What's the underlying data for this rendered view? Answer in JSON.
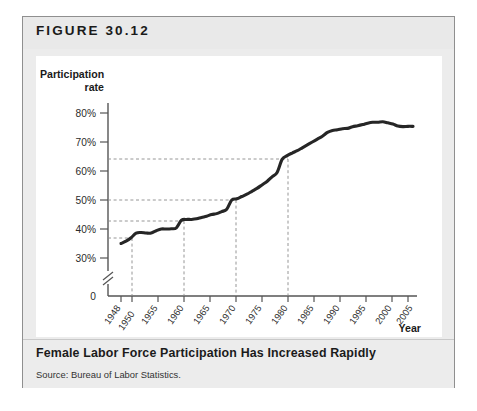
{
  "figure": {
    "label": "FIGURE 30.12",
    "caption_title": "Female Labor Force Participation Has Increased Rapidly",
    "source": "Source: Bureau of Labor Statistics."
  },
  "chart_data": {
    "type": "line",
    "title": "Female Labor Force Participation Has Increased Rapidly",
    "xlabel": "Year",
    "ylabel": "Participation rate",
    "ylabel_line1": "Participation",
    "ylabel_line2": "rate",
    "grid": false,
    "legend": "none",
    "axis_break": true,
    "axis_break_note": "y-axis broken between 0 and 30%",
    "xlim": [
      1948,
      2007
    ],
    "ylim": [
      28,
      82
    ],
    "ytick_labels": [
      "30%",
      "40%",
      "50%",
      "60%",
      "70%",
      "80%"
    ],
    "ytick_values": [
      30,
      40,
      50,
      60,
      70,
      80
    ],
    "zero_label": "0",
    "xtick_labels": [
      "1948",
      "1950",
      "1955",
      "1960",
      "1965",
      "1970",
      "1975",
      "1980",
      "1985",
      "1990",
      "1995",
      "2000",
      "2005"
    ],
    "xtick_values": [
      1948,
      1950,
      1955,
      1960,
      1965,
      1970,
      1975,
      1980,
      1985,
      1990,
      1995,
      2000,
      2005
    ],
    "guides": [
      {
        "year": 1950,
        "value": 37
      },
      {
        "year": 1960,
        "value": 43
      },
      {
        "year": 1970,
        "value": 50
      },
      {
        "year": 1980,
        "value": 64
      }
    ],
    "series": [
      {
        "name": "Female labor force participation rate",
        "x": [
          1948,
          1949,
          1950,
          1951,
          1952,
          1953,
          1954,
          1955,
          1956,
          1957,
          1958,
          1959,
          1960,
          1961,
          1962,
          1963,
          1964,
          1965,
          1966,
          1967,
          1968,
          1969,
          1970,
          1971,
          1972,
          1973,
          1974,
          1975,
          1976,
          1977,
          1978,
          1979,
          1980,
          1981,
          1982,
          1983,
          1984,
          1985,
          1986,
          1987,
          1988,
          1989,
          1990,
          1991,
          1992,
          1993,
          1994,
          1995,
          1996,
          1997,
          1998,
          1999,
          2000,
          2001,
          2002,
          2003,
          2004,
          2005,
          2006
        ],
        "values": [
          35.0,
          35.8,
          37.0,
          38.6,
          38.8,
          38.6,
          38.6,
          39.4,
          40.0,
          40.0,
          40.1,
          40.4,
          43.0,
          43.3,
          43.3,
          43.5,
          44.0,
          44.4,
          45.0,
          45.3,
          46.0,
          46.8,
          50.0,
          50.4,
          51.2,
          52.0,
          53.0,
          54.0,
          55.2,
          56.4,
          58.0,
          59.5,
          64.0,
          65.3,
          66.2,
          67.0,
          68.0,
          69.0,
          70.0,
          71.0,
          72.0,
          73.3,
          74.0,
          74.2,
          74.6,
          74.7,
          75.3,
          75.6,
          76.0,
          76.5,
          76.8,
          76.8,
          77.0,
          76.6,
          76.2,
          75.5,
          75.3,
          75.4,
          75.4
        ]
      }
    ]
  }
}
